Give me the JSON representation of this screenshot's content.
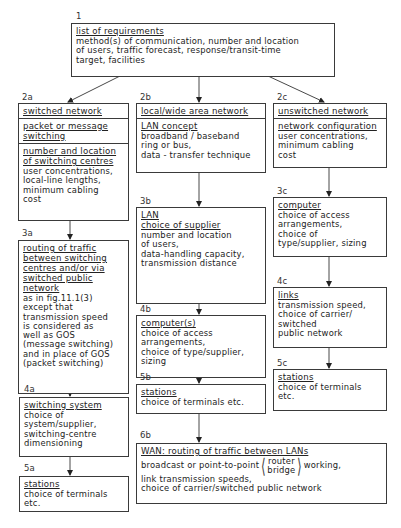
{
  "diagram": {
    "type": "flowchart",
    "nodes": {
      "n1": {
        "label": "1",
        "heading": "list of requirements",
        "text": "method(s) of communication, number and location\nof users, traffic forecast, response/transit-time\ntarget, facilities"
      },
      "n2a": {
        "label": "2a",
        "heading": "switched network",
        "sub1_heading": "packet or message\nswitching",
        "sub2_heading": "number and location\nof switching centres",
        "sub2_text": "user concentrations,\nlocal-line lengths,\nminimum cabling\ncost"
      },
      "n2b": {
        "label": "2b",
        "heading": "local/wide area network",
        "sub_heading": "LAN concept",
        "sub_text": "broadband / baseband\nring or bus,\ndata - transfer technique"
      },
      "n2c": {
        "label": "2c",
        "heading": "unswitched network",
        "sub_heading": "network configuration",
        "sub_text": "user concentrations,\nminimum cabling\ncost"
      },
      "n3a": {
        "label": "3a",
        "heading": "routing of traffic\nbetween switching\ncentres and/or via\nswitched public\nnetwork",
        "text": "as in fig.11.1(3)\nexcept that\ntransmission speed\nis considered as\nwell as GOS\n(message switching)\nand in place of GOS\n(packet switching)"
      },
      "n3b": {
        "label": "3b",
        "heading": "LAN\nchoice of supplier",
        "text": "number and location\nof users,\ndata-handling capacity,\ntransmission distance"
      },
      "n3c": {
        "label": "3c",
        "heading": "computer",
        "text": "choice of access\narrangements,\nchoice of\ntype/supplier, sizing"
      },
      "n4a": {
        "label": "4a",
        "heading": "switching system",
        "text": "choice of\nsystem/supplier,\nswitching-centre\ndimensioning"
      },
      "n4b": {
        "label": "4b",
        "heading": "computer(s)",
        "text": "choice of access\narrangements,\nchoice of type/supplier,\nsizing"
      },
      "n4c": {
        "label": "4c",
        "heading": "links",
        "text": "transmission speed,\nchoice of carrier/\nswitched\npublic network"
      },
      "n5a": {
        "label": "5a",
        "heading": "stations",
        "text": "choice of terminals\netc."
      },
      "n5b": {
        "label": "5b",
        "heading": "stations",
        "text": "choice of terminals etc."
      },
      "n5c": {
        "label": "5c",
        "heading": "stations",
        "text": "choice of terminals\netc."
      },
      "n6b": {
        "label": "6b",
        "heading": "WAN: routing of traffic between LANs",
        "line1_pre": "broadcast or point-to-point",
        "line1_opt1": "router",
        "line1_opt2": "bridge",
        "line1_post": "working,",
        "line2": "link transmission speeds,",
        "line3": "choice of carrier/switched public network"
      }
    },
    "edges": [
      [
        "1",
        "2a"
      ],
      [
        "1",
        "2b"
      ],
      [
        "1",
        "2c"
      ],
      [
        "2a",
        "3a"
      ],
      [
        "3a",
        "4a"
      ],
      [
        "4a",
        "5a"
      ],
      [
        "2b",
        "3b"
      ],
      [
        "3b",
        "4b"
      ],
      [
        "4b",
        "5b"
      ],
      [
        "5b",
        "6b"
      ],
      [
        "2c",
        "3c"
      ],
      [
        "3c",
        "4c"
      ],
      [
        "4c",
        "5c"
      ]
    ]
  }
}
